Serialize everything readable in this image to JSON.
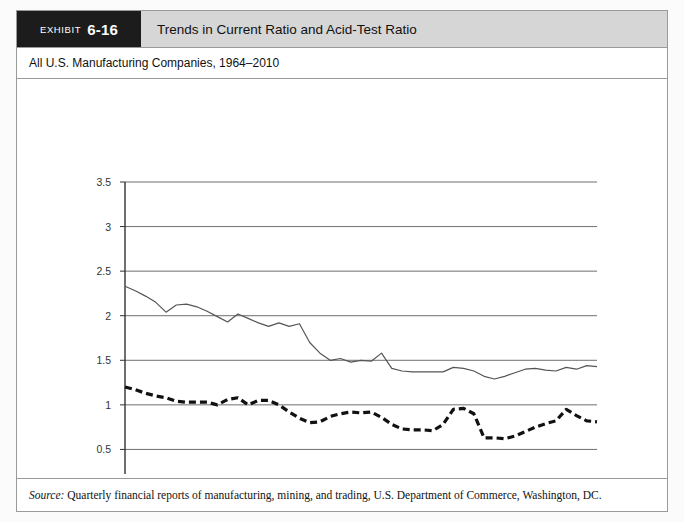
{
  "header": {
    "exhibit_label": "EXHIBIT",
    "exhibit_number": "6-16",
    "title": "Trends in Current Ratio and Acid-Test Ratio"
  },
  "subtitle": "All U.S. Manufacturing Companies, 1964–2010",
  "source": {
    "label": "Source:",
    "text": " Quarterly financial reports of manufacturing, mining, and trading, U.S. Department of Commerce, Washington, DC."
  },
  "legend": {
    "current": "Current Ratio",
    "acid": "Acid Test Ratio"
  },
  "colors": {
    "header_band": "#d6d6d6",
    "header_tab": "#1c1c1c",
    "frame_border": "#9a9a9a",
    "gridline": "#6f6f6f",
    "current_line": "#555555",
    "acid_line": "#111111"
  },
  "chart_data": {
    "type": "line",
    "title": "Trends in Current Ratio and Acid-Test Ratio",
    "subtitle": "All U.S. Manufacturing Companies, 1964–2010",
    "xlabel": "",
    "ylabel": "",
    "ylim": [
      0,
      3.5
    ],
    "yticks": [
      0,
      0.5,
      1,
      1.5,
      2,
      2.5,
      3,
      3.5
    ],
    "ytick_labels": [
      "0",
      "0.5",
      "1",
      "1.5",
      "2",
      "2.5",
      "3",
      "3.5"
    ],
    "xlim": [
      1964,
      2010
    ],
    "grid": true,
    "legend_position": "bottom",
    "x": [
      1964,
      1965,
      1966,
      1967,
      1968,
      1969,
      1970,
      1971,
      1972,
      1973,
      1974,
      1975,
      1976,
      1977,
      1978,
      1979,
      1980,
      1981,
      1982,
      1983,
      1984,
      1985,
      1986,
      1987,
      1988,
      1989,
      1990,
      1991,
      1992,
      1993,
      1994,
      1995,
      1996,
      1997,
      1998,
      1999,
      2000,
      2001,
      2002,
      2003,
      2004,
      2005,
      2006,
      2007,
      2008,
      2009,
      2010
    ],
    "xtick_labels": [
      "1964",
      "1967",
      "1969",
      "1971",
      "1973",
      "1975",
      "1977",
      "1979",
      "1981",
      "1983",
      "1985",
      "1987",
      "1989",
      "1991",
      "1993",
      "1995",
      "1997",
      "1999",
      "2001",
      "2003",
      "2005",
      "2007",
      "2009",
      "2010"
    ],
    "series": [
      {
        "name": "Current Ratio",
        "style": "solid",
        "values": [
          2.33,
          2.28,
          2.22,
          2.15,
          2.04,
          2.12,
          2.13,
          2.1,
          2.05,
          1.99,
          1.93,
          2.02,
          1.97,
          1.92,
          1.88,
          1.92,
          1.88,
          1.91,
          1.7,
          1.58,
          1.5,
          1.52,
          1.48,
          1.5,
          1.49,
          1.58,
          1.41,
          1.38,
          1.37,
          1.37,
          1.37,
          1.37,
          1.42,
          1.41,
          1.38,
          1.32,
          1.29,
          1.32,
          1.36,
          1.4,
          1.41,
          1.39,
          1.38,
          1.42,
          1.4,
          1.44,
          1.43
        ]
      },
      {
        "name": "Acid Test Ratio",
        "style": "dashed",
        "values": [
          1.2,
          1.17,
          1.13,
          1.1,
          1.08,
          1.04,
          1.03,
          1.03,
          1.03,
          1.0,
          1.06,
          1.08,
          1.0,
          1.05,
          1.05,
          1.0,
          0.92,
          0.85,
          0.8,
          0.81,
          0.87,
          0.9,
          0.92,
          0.91,
          0.92,
          0.86,
          0.78,
          0.73,
          0.72,
          0.72,
          0.71,
          0.78,
          0.95,
          0.96,
          0.9,
          0.63,
          0.63,
          0.62,
          0.65,
          0.7,
          0.75,
          0.79,
          0.82,
          0.95,
          0.88,
          0.82,
          0.81
        ]
      }
    ]
  }
}
